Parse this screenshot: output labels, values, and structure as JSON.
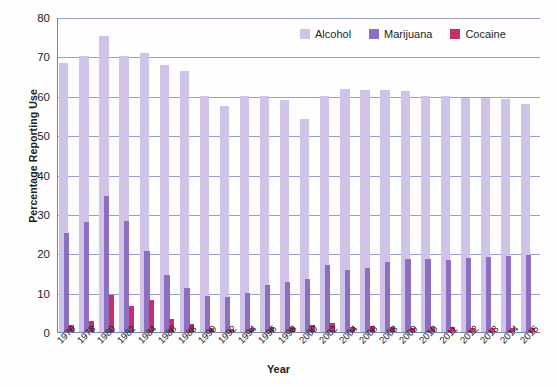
{
  "chart_data": {
    "type": "bar",
    "title": "",
    "xlabel": "Year",
    "ylabel": "Percentage Reporting Use",
    "ylim": [
      0,
      80
    ],
    "ytick_step": 10,
    "yticks": [
      0,
      10,
      20,
      30,
      40,
      50,
      60,
      70,
      80
    ],
    "grid": true,
    "legend_position": "top-right",
    "categories": [
      "1976",
      "1978",
      "1980",
      "1982",
      "1984",
      "1986",
      "1988",
      "1990",
      "1992",
      "1994",
      "1996",
      "1998",
      "2000",
      "2002",
      "2004",
      "2006",
      "2008",
      "2009",
      "2010",
      "2011",
      "2012",
      "2013",
      "2014",
      "2015"
    ],
    "series": [
      {
        "name": "Alcohol",
        "color": "#cfc3e8",
        "values": [
          68.3,
          70.1,
          75.3,
          70.0,
          70.8,
          67.9,
          66.2,
          60.0,
          57.5,
          60.0,
          59.9,
          58.8,
          54.2,
          60.0,
          61.8,
          61.5,
          61.5,
          61.2,
          60.0,
          60.0,
          59.5,
          59.5,
          59.2,
          57.8
        ]
      },
      {
        "name": "Marijuana",
        "color": "#8c6fc0",
        "values": [
          25.2,
          28.0,
          34.5,
          28.1,
          20.6,
          14.6,
          11.1,
          9.2,
          8.9,
          10.0,
          12.0,
          12.6,
          13.5,
          16.9,
          15.8,
          16.2,
          17.9,
          18.5,
          18.5,
          18.4,
          18.9,
          19.0,
          19.4,
          19.6
        ]
      },
      {
        "name": "Cocaine",
        "color": "#c62f68",
        "values": [
          1.8,
          2.9,
          9.5,
          6.6,
          8.2,
          3.4,
          2.1,
          0.9,
          0.8,
          1.0,
          1.2,
          1.3,
          1.8,
          2.2,
          1.3,
          1.6,
          1.3,
          1.0,
          1.3,
          1.2,
          1.0,
          0.9,
          1.0,
          1.1
        ]
      }
    ]
  },
  "legend": {
    "items": [
      {
        "label": "Alcohol",
        "color": "#cfc3e8"
      },
      {
        "label": "Marijuana",
        "color": "#8c6fc0"
      },
      {
        "label": "Cocaine",
        "color": "#c62f68"
      }
    ]
  },
  "axes": {
    "y_title": "Percentage Reporting Use",
    "x_title": "Year"
  }
}
